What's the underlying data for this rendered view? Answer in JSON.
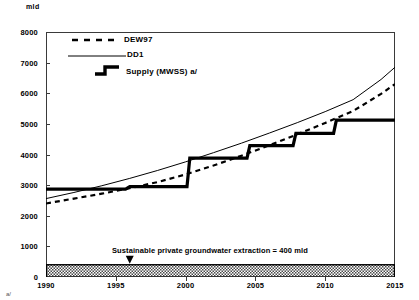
{
  "figure": {
    "unit_label": "mld",
    "footnote": "a/"
  },
  "annotation": {
    "text": "Sustainable private groundwater  extraction = 400 mld",
    "marker_year": 1996,
    "band_value": 400
  },
  "legend": {
    "items": [
      {
        "label": "DEW97",
        "style": "dashed",
        "icon": "dashed-line-icon"
      },
      {
        "label": "DD1",
        "style": "solid-thin",
        "icon": "solid-line-icon"
      },
      {
        "label": "Supply (MWSS) a/",
        "style": "step-thick",
        "icon": "step-line-icon"
      }
    ]
  },
  "chart_data": {
    "type": "line",
    "title": "",
    "xlabel": "",
    "ylabel": "mld",
    "xlim": [
      1990,
      2015
    ],
    "ylim": [
      0,
      8000
    ],
    "xticks": [
      1990,
      1995,
      2000,
      2005,
      2010,
      2015
    ],
    "yticks": [
      0,
      1000,
      2000,
      3000,
      4000,
      5000,
      6000,
      7000,
      8000
    ],
    "grid": false,
    "legend_position": "top-left-inside",
    "series": [
      {
        "name": "DEW97",
        "style": "dashed",
        "x": [
          1990,
          1992,
          1994,
          1996,
          1998,
          2000,
          2002,
          2004,
          2006,
          2008,
          2010,
          2012,
          2014,
          2015
        ],
        "values": [
          2400,
          2560,
          2720,
          2900,
          3100,
          3350,
          3640,
          3960,
          4300,
          4660,
          5030,
          5420,
          5980,
          6300
        ]
      },
      {
        "name": "DD1",
        "style": "solid",
        "x": [
          1990,
          1992,
          1994,
          1996,
          1998,
          2000,
          2002,
          2004,
          2006,
          2008,
          2010,
          2012,
          2014,
          2015
        ],
        "values": [
          2560,
          2760,
          2980,
          3220,
          3480,
          3760,
          4060,
          4370,
          4700,
          5040,
          5400,
          5790,
          6450,
          6850
        ]
      },
      {
        "name": "Supply (MWSS) a/",
        "style": "step",
        "x": [
          1990.0,
          1991.6,
          1995.7,
          1996.0,
          1999.9,
          2000.1,
          2000.3,
          2004.4,
          2004.6,
          2007.7,
          2007.9,
          2010.6,
          2010.8,
          2015.0
        ],
        "values": [
          2870,
          2870,
          2870,
          2950,
          2950,
          2950,
          3880,
          3880,
          4290,
          4290,
          4690,
          4690,
          5120,
          5120
        ],
        "steps": [
          {
            "from_year": 1991.6,
            "to_year": 1995.7,
            "value": 2870
          },
          {
            "from_year": 1995.7,
            "to_year": 1999.9,
            "value": 2950
          },
          {
            "from_year": 2000.3,
            "to_year": 2004.4,
            "value": 3880
          },
          {
            "from_year": 2004.6,
            "to_year": 2007.7,
            "value": 4290
          },
          {
            "from_year": 2007.9,
            "to_year": 2010.6,
            "value": 4690
          },
          {
            "from_year": 2010.8,
            "to_year": 2015.0,
            "value": 5120
          }
        ]
      }
    ],
    "bands": [
      {
        "name": "sustainable-groundwater-band",
        "from": 0,
        "to": 400,
        "hatch": "crosshatch"
      }
    ]
  }
}
